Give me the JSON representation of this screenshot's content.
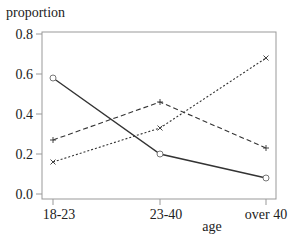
{
  "chart_data": {
    "type": "line",
    "title": "",
    "xlabel": "age",
    "ylabel": "proportion",
    "categories": [
      "18-23",
      "23-40",
      "over 40"
    ],
    "ylim": [
      0.0,
      0.8
    ],
    "yticks": [
      "0.0",
      "0.2",
      "0.4",
      "0.6",
      "0.8"
    ],
    "grid": false,
    "legend": null,
    "series": [
      {
        "name": "solid (circle markers)",
        "style": "solid",
        "marker": "circle",
        "values": [
          0.58,
          0.2,
          0.08
        ]
      },
      {
        "name": "dashed (plus markers)",
        "style": "dashed",
        "marker": "plus",
        "values": [
          0.27,
          0.46,
          0.23
        ]
      },
      {
        "name": "dotted (cross markers)",
        "style": "dotted",
        "marker": "cross",
        "values": [
          0.16,
          0.33,
          0.68
        ]
      }
    ]
  },
  "colors": {
    "axis": "#888888",
    "line": "#333333",
    "text": "#222222"
  }
}
